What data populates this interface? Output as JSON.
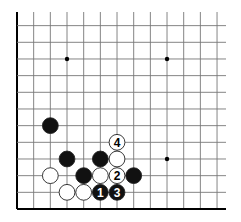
{
  "diagram": {
    "type": "go-board-corner",
    "corner": "bottom-left",
    "grid": {
      "origin_x": 17,
      "origin_y": 209,
      "spacing": 16.67,
      "columns": 13,
      "rows": 12,
      "line_extent_right": 226,
      "line_extent_top": 12,
      "line_color": "#777777",
      "edge_color": "#000000"
    },
    "star_points": [
      {
        "col": 4,
        "row": 10
      },
      {
        "col": 10,
        "row": 10
      },
      {
        "col": 10,
        "row": 4
      }
    ],
    "stones": [
      {
        "color": "black",
        "col": 3,
        "row": 6,
        "label": ""
      },
      {
        "color": "black",
        "col": 4,
        "row": 4,
        "label": ""
      },
      {
        "color": "black",
        "col": 6,
        "row": 4,
        "label": ""
      },
      {
        "color": "white",
        "col": 7,
        "row": 5,
        "label": "4"
      },
      {
        "color": "white",
        "col": 7,
        "row": 4,
        "label": ""
      },
      {
        "color": "white",
        "col": 3,
        "row": 3,
        "label": ""
      },
      {
        "color": "black",
        "col": 5,
        "row": 3,
        "label": ""
      },
      {
        "color": "white",
        "col": 6,
        "row": 3,
        "label": ""
      },
      {
        "color": "white",
        "col": 7,
        "row": 3,
        "label": "2"
      },
      {
        "color": "black",
        "col": 8,
        "row": 3,
        "label": ""
      },
      {
        "color": "white",
        "col": 4,
        "row": 2,
        "label": ""
      },
      {
        "color": "white",
        "col": 5,
        "row": 2,
        "label": ""
      },
      {
        "color": "black",
        "col": 6,
        "row": 2,
        "label": "1"
      },
      {
        "color": "black",
        "col": 7,
        "row": 2,
        "label": "3"
      }
    ],
    "colors": {
      "black_stone": "#111111",
      "white_stone": "#ffffff",
      "stone_outline": "#222222"
    }
  }
}
